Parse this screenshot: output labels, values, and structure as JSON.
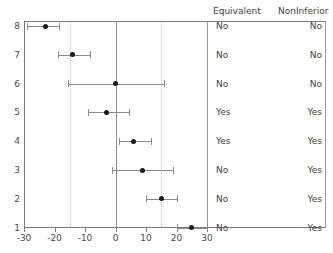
{
  "chart_data": {
    "type": "scatter",
    "title": "",
    "xlabel": "",
    "ylabel": "",
    "xlim": [
      -30,
      30
    ],
    "ylim": [
      0.5,
      8.5
    ],
    "grid": false,
    "legend_position": "none",
    "xticks": [
      -30,
      -20,
      -10,
      0,
      10,
      20,
      30
    ],
    "xticklabels": [
      "-30",
      "-20",
      "-10",
      "0",
      "10",
      "20",
      "30"
    ],
    "yticks": [
      1,
      2,
      3,
      4,
      5,
      6,
      7,
      8
    ],
    "yticklabels": [
      "1",
      "2",
      "3",
      "4",
      "5",
      "6",
      "7",
      "8"
    ],
    "reference_lines": [
      {
        "name": "zero-line",
        "x": 0,
        "style": "solid",
        "color": "#8e8e8e"
      },
      {
        "name": "lower-equivalence-margin",
        "x": -15,
        "style": "dotted",
        "color": "#c9b8b8"
      },
      {
        "name": "upper-equivalence-margin",
        "x": 15,
        "style": "dotted",
        "color": "#c9b8b8"
      }
    ],
    "point_color": "#1a1a1a",
    "interval_color": "#8a8a8a",
    "rows": [
      {
        "y": 8,
        "label": "8",
        "estimate": -23,
        "ci_low": -29,
        "ci_high": -18.5,
        "equivalent": "No",
        "noninferior": "No"
      },
      {
        "y": 7,
        "label": "7",
        "estimate": -14,
        "ci_low": -19,
        "ci_high": -8.5,
        "equivalent": "No",
        "noninferior": "No"
      },
      {
        "y": 6,
        "label": "6",
        "estimate": 0,
        "ci_low": -15.5,
        "ci_high": 16,
        "equivalent": "No",
        "noninferior": "No"
      },
      {
        "y": 5,
        "label": "5",
        "estimate": -3,
        "ci_low": -9,
        "ci_high": 4.5,
        "equivalent": "Yes",
        "noninferior": "Yes"
      },
      {
        "y": 4,
        "label": "4",
        "estimate": 6,
        "ci_low": 1,
        "ci_high": 11.5,
        "equivalent": "Yes",
        "noninferior": "Yes"
      },
      {
        "y": 3,
        "label": "3",
        "estimate": 9,
        "ci_low": -1,
        "ci_high": 19,
        "equivalent": "No",
        "noninferior": "Yes"
      },
      {
        "y": 2,
        "label": "2",
        "estimate": 15,
        "ci_low": 10,
        "ci_high": 20,
        "equivalent": "No",
        "noninferior": "Yes"
      },
      {
        "y": 1,
        "label": "1",
        "estimate": 25,
        "ci_low": 20,
        "ci_high": 30,
        "equivalent": "No",
        "noninferior": "Yes"
      }
    ]
  },
  "table": {
    "headers": {
      "equivalent": "Equivalent",
      "noninferior": "NonInferior"
    }
  }
}
